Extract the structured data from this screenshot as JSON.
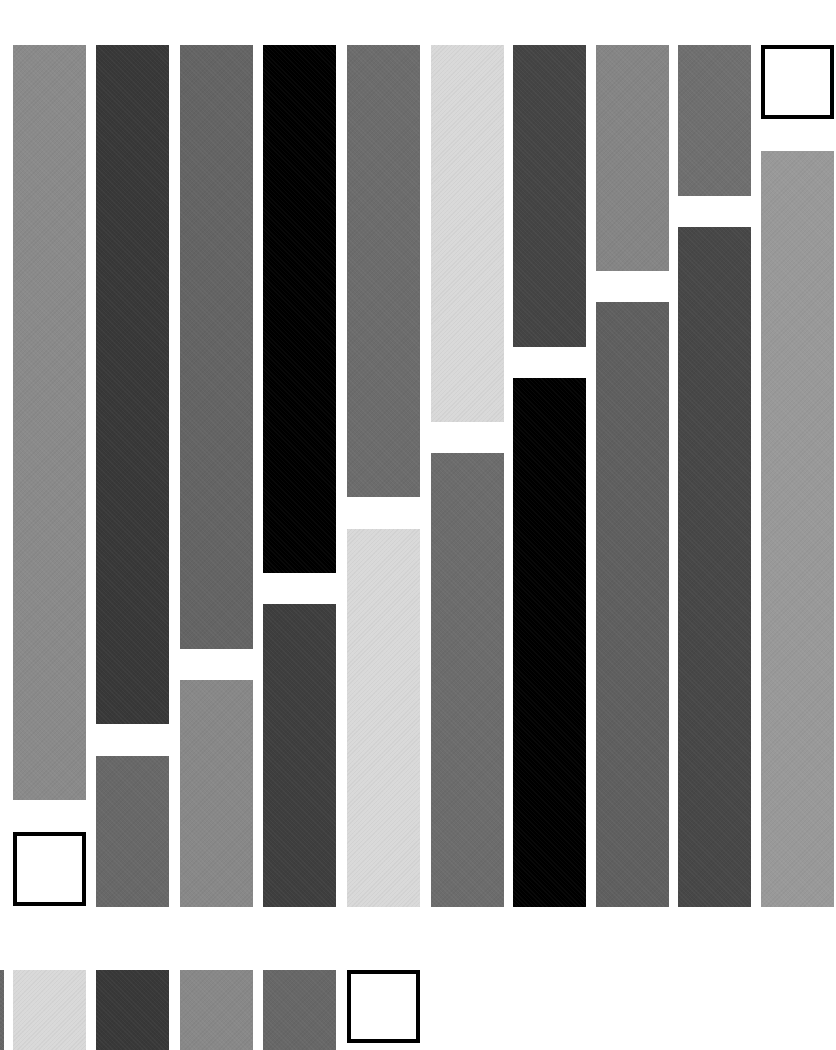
{
  "canvas": {
    "width": 836,
    "height": 1050,
    "background": "#ffffff"
  },
  "palette": {
    "black": "#000000",
    "dark": "#3c3c3c",
    "mid": "#676767",
    "gray": "#8a8a8a",
    "light": "#d8d8d8",
    "white_box": "#ffffff",
    "box_border": "#000000"
  },
  "grid": {
    "column_width": 73,
    "top": 45,
    "bottom": 907,
    "gap": 31,
    "columns": [
      {
        "x": 13,
        "segments": [
          {
            "y": 45,
            "h": 755,
            "color": "#8a8a8a"
          },
          {
            "y": 832,
            "h": 74,
            "color": "#ffffff",
            "box": true
          }
        ]
      },
      {
        "x": 96,
        "segments": [
          {
            "y": 45,
            "h": 679,
            "color": "#383838"
          },
          {
            "y": 756,
            "h": 151,
            "color": "#686868"
          }
        ]
      },
      {
        "x": 180,
        "segments": [
          {
            "y": 45,
            "h": 604,
            "color": "#646464"
          },
          {
            "y": 680,
            "h": 227,
            "color": "#888888"
          }
        ]
      },
      {
        "x": 263,
        "segments": [
          {
            "y": 45,
            "h": 528,
            "color": "#000000"
          },
          {
            "y": 604,
            "h": 303,
            "color": "#3e3e3e"
          }
        ]
      },
      {
        "x": 347,
        "segments": [
          {
            "y": 45,
            "h": 452,
            "color": "#6c6c6c"
          },
          {
            "y": 529,
            "h": 378,
            "color": "#d9d9d9"
          }
        ]
      },
      {
        "x": 431,
        "segments": [
          {
            "y": 45,
            "h": 377,
            "color": "#d9d9d9"
          },
          {
            "y": 453,
            "h": 454,
            "color": "#6c6c6c"
          }
        ]
      },
      {
        "x": 513,
        "segments": [
          {
            "y": 45,
            "h": 302,
            "color": "#444444"
          },
          {
            "y": 378,
            "h": 529,
            "color": "#000000"
          }
        ]
      },
      {
        "x": 596,
        "segments": [
          {
            "y": 45,
            "h": 226,
            "color": "#858585"
          },
          {
            "y": 302,
            "h": 605,
            "color": "#5f5f5f"
          }
        ]
      },
      {
        "x": 678,
        "segments": [
          {
            "y": 45,
            "h": 151,
            "color": "#6f6f6f"
          },
          {
            "y": 227,
            "h": 680,
            "color": "#474747"
          }
        ]
      },
      {
        "x": 761,
        "segments": [
          {
            "y": 45,
            "h": 74,
            "color": "#ffffff",
            "box": true
          },
          {
            "y": 151,
            "h": 756,
            "color": "#999999"
          }
        ]
      }
    ]
  },
  "bottom_row": {
    "y": 970,
    "h": 80,
    "swatches": [
      {
        "x": 0,
        "w": 4,
        "color": "#676767"
      },
      {
        "x": 13,
        "w": 73,
        "color": "#d9d9d9"
      },
      {
        "x": 96,
        "w": 73,
        "color": "#383838"
      },
      {
        "x": 180,
        "w": 73,
        "color": "#888888"
      },
      {
        "x": 263,
        "w": 73,
        "color": "#676767"
      },
      {
        "x": 347,
        "w": 73,
        "h": 73,
        "color": "#ffffff",
        "box": true
      }
    ]
  }
}
